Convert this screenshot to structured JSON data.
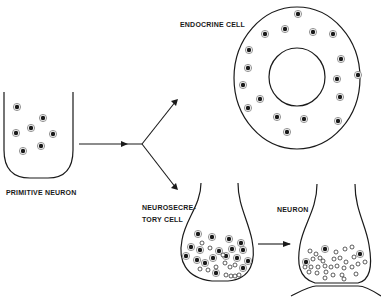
{
  "labels": {
    "primitive_neuron": "PRIMITIVE NEURON",
    "endocrine_cell": "ENDOCRINE CELL",
    "neurosecretory_line1": "NEUROSECRE-",
    "neurosecretory_line2": "TORY CELL",
    "neuron": "NEURON"
  },
  "granule_types": {
    "dense_core": "dense-core granule (filled)",
    "clear_vesicle": "clear vesicle (open)"
  },
  "counts": {
    "primitive_neuron_dense_core": 7,
    "endocrine_cell_dense_core": 18,
    "neurosecretory_cell_dense_core": 18,
    "neurosecretory_cell_clear": 13,
    "neuron_dense_core": 3,
    "neuron_clear": 30
  },
  "colors": {
    "ink": "#1a1a1a",
    "background": "#ffffff"
  }
}
